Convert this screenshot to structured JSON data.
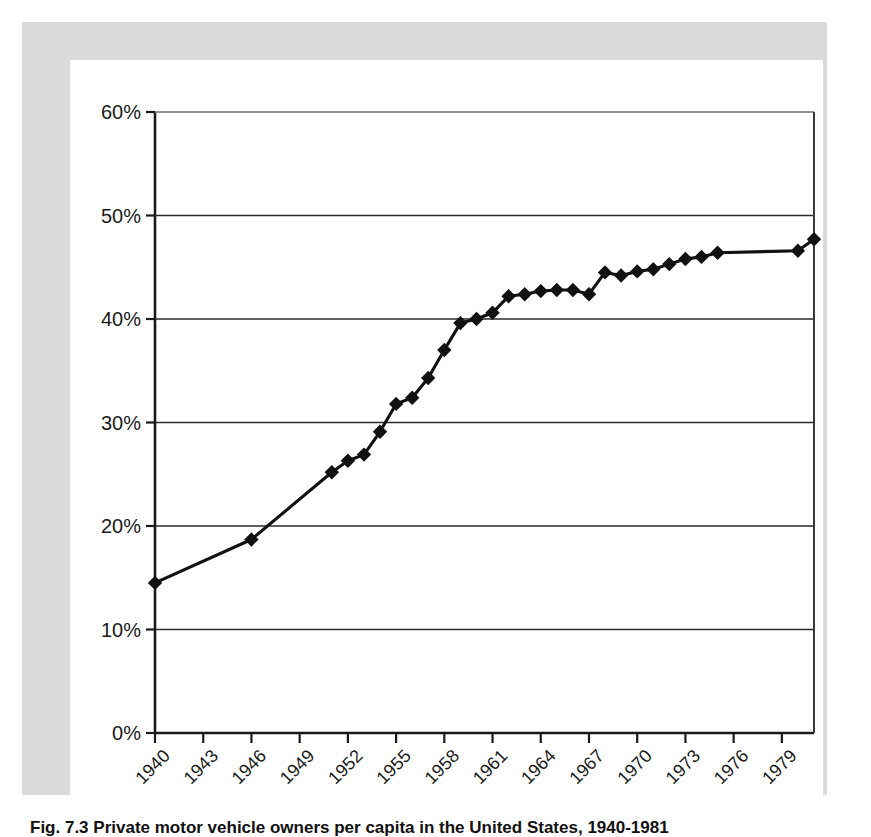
{
  "figure": {
    "caption": "Fig. 7.3  Private motor vehicle owners per capita in the United States, 1940-1981",
    "caption_visible_fragment": "Fig. 7.3  Private motor vehicle..."
  },
  "chart_data": {
    "type": "line",
    "title": "",
    "xlabel": "",
    "ylabel": "",
    "xlim": [
      1940,
      1981
    ],
    "ylim": [
      0,
      60
    ],
    "grid": true,
    "legend": null,
    "y_tick_labels": [
      "0%",
      "10%",
      "20%",
      "30%",
      "40%",
      "50%",
      "60%"
    ],
    "y_tick_values": [
      0,
      10,
      20,
      30,
      40,
      50,
      60
    ],
    "x_tick_labels": [
      "1940",
      "1943",
      "1946",
      "1949",
      "1952",
      "1955",
      "1958",
      "1961",
      "1964",
      "1967",
      "1970",
      "1973",
      "1976",
      "1979"
    ],
    "x_tick_values": [
      1940,
      1943,
      1946,
      1949,
      1952,
      1955,
      1958,
      1961,
      1964,
      1967,
      1970,
      1973,
      1976,
      1979
    ],
    "marker": "diamond",
    "marker_color": "#111111",
    "line_color": "#111111",
    "series": [
      {
        "name": "percent",
        "x": [
          1940,
          1946,
          1951,
          1952,
          1953,
          1954,
          1955,
          1956,
          1957,
          1958,
          1959,
          1960,
          1961,
          1962,
          1963,
          1964,
          1965,
          1966,
          1967,
          1968,
          1969,
          1970,
          1971,
          1972,
          1973,
          1974,
          1975,
          1980,
          1981
        ],
        "values": [
          14.5,
          18.7,
          25.2,
          26.3,
          26.9,
          29.1,
          31.8,
          32.4,
          34.3,
          37.0,
          39.6,
          40.0,
          40.6,
          42.2,
          42.4,
          42.7,
          42.8,
          42.8,
          42.4,
          44.5,
          44.2,
          44.6,
          44.8,
          45.3,
          45.8,
          46.0,
          46.4,
          46.6,
          47.7
        ]
      }
    ]
  }
}
